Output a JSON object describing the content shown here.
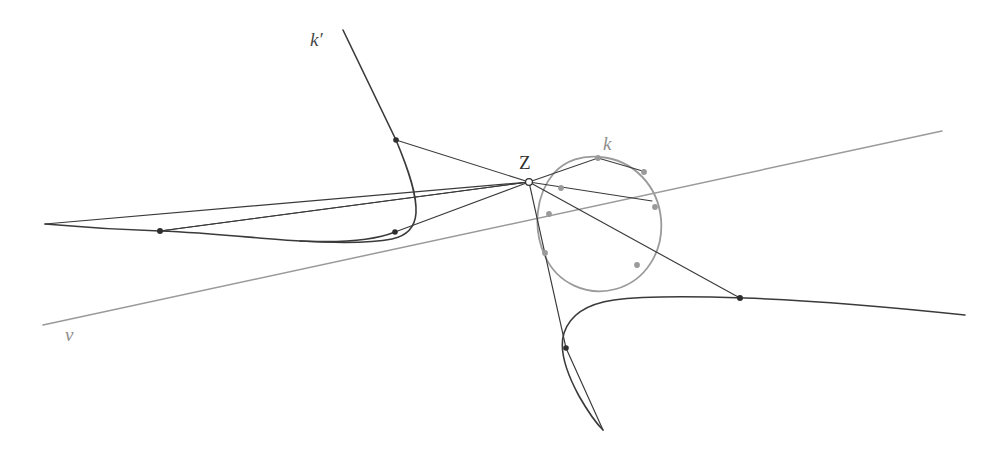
{
  "figure": {
    "width": 985,
    "height": 462,
    "background_color": "#ffffff",
    "colors": {
      "dark_stroke": "#3a3a3a",
      "light_stroke": "#9a9a9a",
      "point_dark": "#2e2e2e",
      "point_gray": "#9a9a9a",
      "label_dark": "#2e2e2e",
      "label_gray": "#8e8e8e"
    },
    "labels": [
      {
        "id": "k-prime",
        "text": "k′",
        "x": 318,
        "y": 46,
        "style": "italic",
        "color": "#4a4a4a"
      },
      {
        "id": "k",
        "text": "k",
        "x": 604,
        "y": 150,
        "style": "italic",
        "color": "#8e8e8e"
      },
      {
        "id": "Z",
        "text": "Z",
        "x": 520,
        "y": 168,
        "style": "upright",
        "color": "#2e2e2e"
      },
      {
        "id": "v",
        "text": "v",
        "x": 66,
        "y": 340,
        "style": "italic",
        "color": "#8e8e8e"
      }
    ],
    "points": [
      {
        "id": "Z-centre",
        "x": 529,
        "y": 182,
        "kind": "open",
        "r": 3.4
      },
      {
        "id": "p-kprime-upper",
        "x": 396,
        "y": 140,
        "kind": "dark",
        "r": 2.6
      },
      {
        "id": "p-kprime-lower",
        "x": 395,
        "y": 232,
        "kind": "dark",
        "r": 2.6
      },
      {
        "id": "p-left-curve",
        "x": 160,
        "y": 231,
        "kind": "dark",
        "r": 2.8
      },
      {
        "id": "p-right-curve",
        "x": 740,
        "y": 298,
        "kind": "dark",
        "r": 2.8
      },
      {
        "id": "p-lower-branch",
        "x": 566,
        "y": 348,
        "kind": "dark",
        "r": 2.6
      },
      {
        "id": "p-conic-top",
        "x": 598,
        "y": 158,
        "kind": "gray",
        "r": 2.8
      },
      {
        "id": "p-conic-upper-right",
        "x": 641,
        "y": 172,
        "kind": "gray",
        "r": 2.8
      },
      {
        "id": "p-conic-right",
        "x": 655,
        "y": 212,
        "kind": "gray",
        "r": 2.8
      },
      {
        "id": "p-conic-lower-right",
        "x": 629,
        "y": 263,
        "kind": "gray",
        "r": 2.8
      },
      {
        "id": "p-conic-left-upper",
        "x": 561,
        "y": 188,
        "kind": "gray",
        "r": 2.8
      },
      {
        "id": "p-conic-left",
        "x": 549,
        "y": 214,
        "kind": "gray",
        "r": 2.8
      },
      {
        "id": "p-conic-lower-left",
        "x": 545,
        "y": 253,
        "kind": "gray",
        "r": 2.8
      }
    ],
    "curves": [
      {
        "id": "k-prime-curve",
        "color": "dark",
        "note": "branch descending from upper left, turning sharply right of its apex"
      },
      {
        "id": "left-long-curve",
        "color": "dark",
        "note": "nearly horizontal sagging branch across the left half"
      },
      {
        "id": "right-branch-curve",
        "color": "dark",
        "note": "hyperbola-like branch in the lower right quadrant"
      },
      {
        "id": "conic-k",
        "color": "gray",
        "note": "tilted ellipse labelled k"
      }
    ],
    "lines": [
      {
        "id": "line-v",
        "color": "gray",
        "from": [
          43,
          325
        ],
        "to": [
          942,
          131
        ],
        "note": "axis v"
      },
      {
        "id": "ray-Z-kprime-upper",
        "color": "dark",
        "from": [
          396,
          140
        ],
        "to": [
          529,
          182
        ]
      },
      {
        "id": "ray-Z-kprime-lower",
        "color": "dark",
        "from": [
          395,
          232
        ],
        "to": [
          529,
          182
        ]
      },
      {
        "id": "ray-Z-left-point",
        "color": "dark",
        "from": [
          160,
          231
        ],
        "to": [
          529,
          182
        ]
      },
      {
        "id": "ray-Z-conic-top",
        "color": "dark",
        "from": [
          529,
          182
        ],
        "to": [
          641,
          172
        ]
      },
      {
        "id": "ray-Z-right-point",
        "color": "dark",
        "from": [
          529,
          182
        ],
        "to": [
          740,
          298
        ]
      },
      {
        "id": "ray-Z-lower-branch",
        "color": "dark",
        "from": [
          529,
          182
        ],
        "to": [
          603,
          430
        ]
      },
      {
        "id": "ray-Z-conic-secant",
        "color": "dark",
        "from": [
          529,
          182
        ],
        "to": [
          598,
          158
        ]
      }
    ]
  }
}
